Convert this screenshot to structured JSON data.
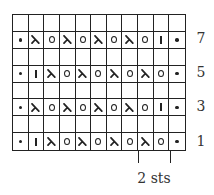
{
  "diagram": {
    "type": "knitting-chart",
    "columns": 11,
    "rows_total": 8,
    "colors": {
      "grid": "#222222",
      "symbol": "#222222",
      "label": "#333333",
      "background": "#ffffff"
    },
    "legend_symbols": {
      "purl": "•",
      "ssk": "λ",
      "yo": "O",
      "knit": "|",
      "blank": ""
    },
    "chart_rows": [
      {
        "row_label": "",
        "cells": [
          "",
          "",
          "",
          "",
          "",
          "",
          "",
          "",
          "",
          "",
          ""
        ]
      },
      {
        "row_label": "7",
        "cells": [
          "purl",
          "ssk",
          "yo",
          "ssk",
          "yo",
          "ssk",
          "yo",
          "ssk",
          "yo",
          "knit",
          "purl"
        ]
      },
      {
        "row_label": "",
        "cells": [
          "",
          "",
          "",
          "",
          "",
          "",
          "",
          "",
          "",
          "",
          ""
        ]
      },
      {
        "row_label": "5",
        "cells": [
          "purl",
          "knit",
          "ssk",
          "yo",
          "ssk",
          "yo",
          "ssk",
          "yo",
          "ssk",
          "yo",
          "purl"
        ]
      },
      {
        "row_label": "",
        "cells": [
          "",
          "",
          "",
          "",
          "",
          "",
          "",
          "",
          "",
          "",
          ""
        ]
      },
      {
        "row_label": "3",
        "cells": [
          "purl",
          "ssk",
          "yo",
          "ssk",
          "yo",
          "ssk",
          "yo",
          "ssk",
          "yo",
          "knit",
          "purl"
        ]
      },
      {
        "row_label": "",
        "cells": [
          "",
          "",
          "",
          "",
          "",
          "",
          "",
          "",
          "",
          "",
          ""
        ]
      },
      {
        "row_label": "1",
        "cells": [
          "purl",
          "knit",
          "ssk",
          "yo",
          "ssk",
          "yo",
          "ssk",
          "yo",
          "ssk",
          "yo",
          "purl"
        ]
      }
    ],
    "row_numbers": [
      "7",
      "5",
      "3",
      "1"
    ],
    "repeat": {
      "label": "2 sts",
      "start_col": 9,
      "end_col": 10
    }
  }
}
